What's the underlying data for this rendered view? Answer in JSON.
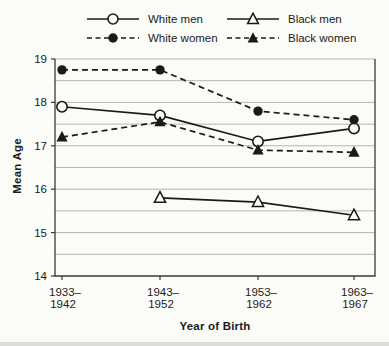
{
  "chart_data": {
    "type": "line",
    "title": "",
    "xlabel": "Year of Birth",
    "ylabel": "Mean Age",
    "ylim": [
      14,
      19
    ],
    "ytick_step": 1,
    "grid_step": 0.5,
    "grid": true,
    "legend_position": "top",
    "categories": [
      "1933–1942",
      "1943–1952",
      "1953–1962",
      "1963–1967"
    ],
    "category_labels": [
      [
        "1933–",
        "1942"
      ],
      [
        "1943–",
        "1952"
      ],
      [
        "1953–",
        "1962"
      ],
      [
        "1963–",
        "1967"
      ]
    ],
    "series": [
      {
        "name": "White men",
        "line": "solid",
        "marker": "circle-open",
        "values": [
          17.9,
          17.7,
          17.1,
          17.4
        ]
      },
      {
        "name": "White women",
        "line": "dashed",
        "marker": "circle-filled",
        "values": [
          18.75,
          18.75,
          17.8,
          17.6
        ]
      },
      {
        "name": "Black men",
        "line": "solid",
        "marker": "triangle-open",
        "values": [
          null,
          15.8,
          15.7,
          15.4
        ]
      },
      {
        "name": "Black women",
        "line": "dashed",
        "marker": "triangle-filled",
        "values": [
          17.2,
          17.55,
          16.9,
          16.85
        ]
      }
    ],
    "colors": {
      "line": "#1a1a1a",
      "grid": "#b4b4b4",
      "axis": "#3a3a3a",
      "text": "#1c1c1c",
      "background": "#fbfbf8"
    }
  }
}
